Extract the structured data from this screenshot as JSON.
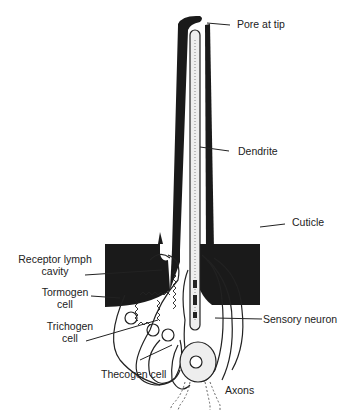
{
  "diagram": {
    "labels": {
      "pore": "Pore at tip",
      "dendrite": "Dendrite",
      "cuticle": "Cuticle",
      "receptor_lymph_line1": "Receptor lymph",
      "receptor_lymph_line2": "cavity",
      "tormogen_line1": "Tormogen",
      "tormogen_line2": "cell",
      "trichogen_line1": "Trichogen",
      "trichogen_line2": "cell",
      "sensory_neuron": "Sensory neuron",
      "thecogen": "Thecogen cell",
      "axons": "Axons"
    }
  }
}
